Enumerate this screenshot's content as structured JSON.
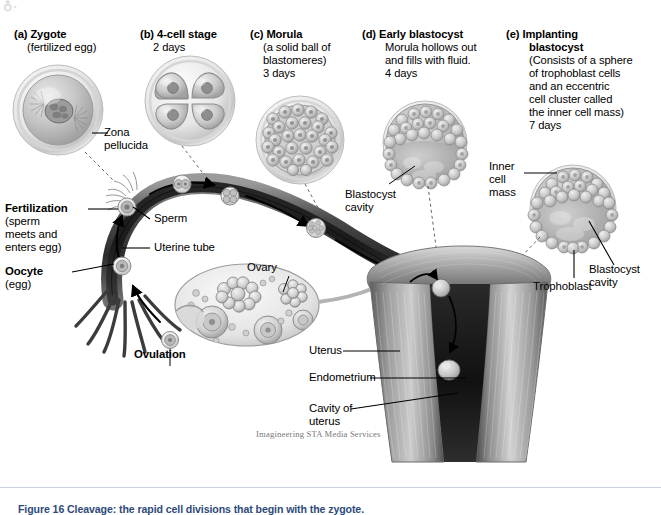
{
  "figure": {
    "background": "#ffffff",
    "credit": "Imagineering STA Media Services",
    "logo_glyph": "♁·",
    "caption": "Figure 16    Cleavage: the rapid cell divisions that begin with the zygote."
  },
  "panels": [
    {
      "id": "a",
      "tag": "(a)",
      "title": "Zygote",
      "lines": [
        "(fertilized egg)"
      ],
      "cell_type": "zygote"
    },
    {
      "id": "b",
      "tag": "(b)",
      "title": "4-cell stage",
      "lines": [
        "2 days"
      ],
      "cell_type": "four-cell"
    },
    {
      "id": "c",
      "tag": "(c)",
      "title": "Morula",
      "lines": [
        "(a solid ball of",
        "blastomeres)",
        "3 days"
      ],
      "cell_type": "morula"
    },
    {
      "id": "d",
      "tag": "(d)",
      "title": "Early blastocyst",
      "lines": [
        "Morula hollows out",
        "and fills with fluid.",
        "4 days"
      ],
      "cell_type": "early-blastocyst"
    },
    {
      "id": "e",
      "tag": "(e)",
      "title": "Implanting",
      "title2": "blastocyst",
      "lines": [
        "(Consists of a sphere",
        "of trophoblast cells",
        "and an eccentric",
        "cell cluster called",
        "the inner cell mass)",
        "7 days"
      ],
      "cell_type": "implanting-blastocyst"
    }
  ],
  "labels": {
    "zona_pellucida": [
      "Zona",
      "pellucida"
    ],
    "fertilization": "Fertilization",
    "fertilization_sub": [
      "(sperm",
      "meets and",
      "enters egg)"
    ],
    "sperm": "Sperm",
    "uterine_tube": "Uterine tube",
    "oocyte": "Oocyte",
    "oocyte_sub": "(egg)",
    "ovulation": "Ovulation",
    "ovary": "Ovary",
    "blastocyst_cavity_d": [
      "Blastocyst",
      "cavity"
    ],
    "inner_cell_mass": [
      "Inner",
      "cell",
      "mass"
    ],
    "trophoblast": "Trophoblast",
    "blastocyst_cavity_e": [
      "Blastocyst",
      "cavity"
    ],
    "uterus": "Uterus",
    "endometrium": "Endometrium",
    "cavity_of_uterus": [
      "Cavity of",
      "uterus"
    ]
  }
}
